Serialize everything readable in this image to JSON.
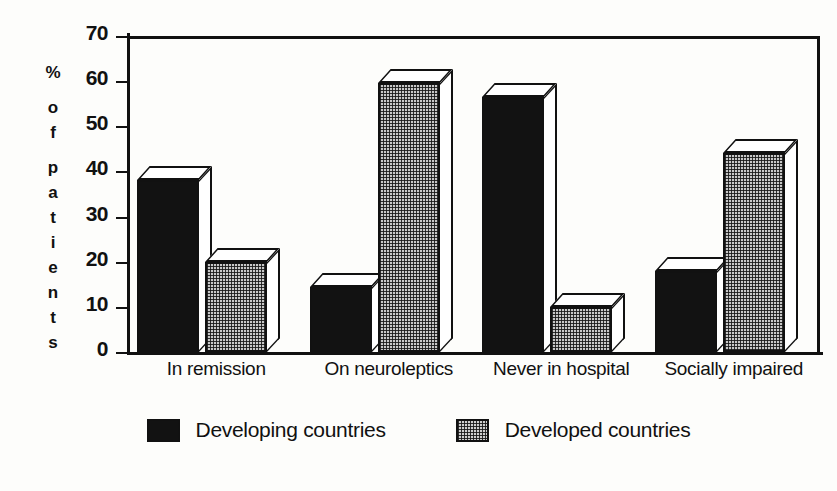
{
  "chart_data": {
    "type": "bar",
    "title": "",
    "subtitle": "",
    "xlabel": "",
    "ylabel": "% of patients",
    "ylabel_chars": [
      "%",
      "o",
      "f",
      "p",
      "a",
      "t",
      "i",
      "e",
      "n",
      "t",
      "s"
    ],
    "ylim": [
      0,
      70
    ],
    "ytick_step": 10,
    "yticks": [
      "0",
      "10",
      "20",
      "30",
      "40",
      "50",
      "60",
      "70"
    ],
    "grid": false,
    "legend_position": "bottom-center",
    "categories": [
      "In remission",
      "On neuroleptics",
      "Never in hospital",
      "Socially impaired"
    ],
    "series": [
      {
        "name": "Developing countries",
        "fill": "solid-black",
        "color": "#121212",
        "values": [
          38,
          14.5,
          56.5,
          18
        ]
      },
      {
        "name": "Developed countries",
        "fill": "checkered-gray",
        "color": "#c8c8c8",
        "values": [
          20,
          59.5,
          10,
          44
        ]
      }
    ]
  },
  "legend": {
    "items": [
      {
        "label": "Developing countries",
        "swatch": "dark"
      },
      {
        "label": "Developed countries",
        "swatch": "light"
      }
    ]
  },
  "axes": {
    "y_title": "% of patients",
    "y_ticks": [
      "70",
      "60",
      "50",
      "40",
      "30",
      "20",
      "10",
      "0"
    ]
  }
}
